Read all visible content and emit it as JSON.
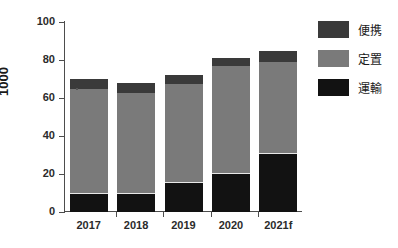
{
  "chart_data": {
    "type": "bar",
    "subtype": "stacked",
    "title": "",
    "xlabel": "",
    "ylabel": "1000",
    "categories": [
      "2017",
      "2018",
      "2019",
      "2020",
      "2021f"
    ],
    "series": [
      {
        "name": "運輸",
        "color": "#121212",
        "values": [
          9.5,
          9.5,
          15.5,
          20,
          30.5
        ]
      },
      {
        "name": "定置",
        "color": "#7a7a7a",
        "values": [
          55,
          53,
          52,
          57,
          48.5
        ]
      },
      {
        "name": "便携",
        "color": "#3a3a3a",
        "values": [
          5.5,
          5.5,
          4.5,
          4,
          6
        ]
      }
    ],
    "totals": [
      70,
      68,
      72,
      81,
      85
    ],
    "ylim": [
      0,
      100
    ],
    "yticks": [
      0,
      20,
      40,
      60,
      80,
      100
    ],
    "ytick_labels": [
      "0",
      "20",
      "40",
      "60",
      "80",
      "100"
    ],
    "grid": false,
    "legend_position": "right",
    "legend_entries": [
      "便携",
      "定置",
      "運輸"
    ]
  },
  "axes": {
    "y_title": "1000",
    "y_tick_labels": [
      "100",
      "80",
      "60",
      "40",
      "20",
      "0"
    ],
    "x_tick_labels": [
      "2017",
      "2018",
      "2019",
      "2020",
      "2021f"
    ]
  },
  "legend": {
    "items": [
      {
        "label": "便携",
        "color": "#3a3a3a"
      },
      {
        "label": "定置",
        "color": "#7a7a7a"
      },
      {
        "label": "運輸",
        "color": "#121212"
      }
    ]
  }
}
